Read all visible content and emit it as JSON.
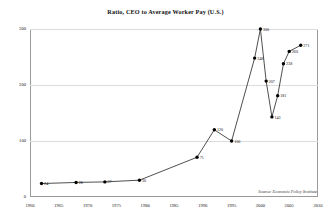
{
  "chart_data": {
    "type": "line",
    "title": "Ratio, CEO to Average Worker Pay (U.S.)",
    "xlabel": "",
    "ylabel": "",
    "xlim": [
      1960,
      2010
    ],
    "ylim": [
      0,
      300
    ],
    "grid": true,
    "legend": false,
    "marker": "filled-circle",
    "line_color": "#222222",
    "marker_color": "#000000",
    "grid_color": "#dcdcdc",
    "x": [
      1962,
      1968,
      1973,
      1979,
      1989,
      1992,
      1995,
      1999,
      2000,
      2001,
      2002,
      2003,
      2004,
      2005,
      2007
    ],
    "values": [
      24,
      26,
      27,
      30,
      71,
      120,
      100,
      248,
      300,
      207,
      143,
      181,
      238,
      260,
      271
    ],
    "point_labels": [
      "24",
      "26",
      "27",
      "30",
      "71",
      "120",
      "100",
      "248",
      "300",
      "207",
      "143",
      "181",
      "238",
      "260",
      "271"
    ],
    "xticks": [
      1960,
      1965,
      1970,
      1975,
      1980,
      1985,
      1990,
      1995,
      2000,
      2005,
      2010
    ],
    "xtick_labels": [
      "1960",
      "1965",
      "1970",
      "1975",
      "1980",
      "1985",
      "1990",
      "1995",
      "2000",
      "2005",
      "2010"
    ],
    "yticks": [
      0,
      100,
      200,
      300
    ],
    "ytick_labels": [
      "0",
      "100",
      "200",
      "300"
    ],
    "annotations": [
      {
        "text": "Source: Economic Policy Institute",
        "position": "bottom-right",
        "style": "italic"
      }
    ]
  },
  "source": {
    "text": "Source: Economic Policy Institute"
  }
}
